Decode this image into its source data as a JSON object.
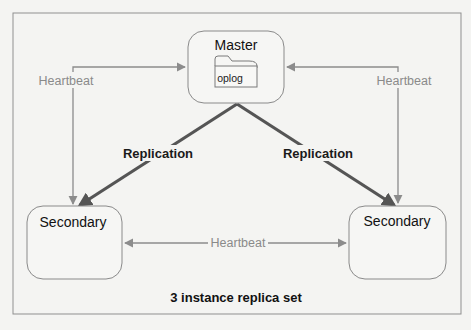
{
  "diagram": {
    "caption": "3 instance replica set",
    "colors": {
      "frame": "#8f8f8f",
      "node_border": "#8a8a8a",
      "node_fill": "#f6f6f4",
      "heartbeat_line": "#8c8c8c",
      "replication_line": "#555555"
    },
    "nodes": {
      "master": {
        "label": "Master",
        "store": "oplog"
      },
      "secondary_left": {
        "label": "Secondary"
      },
      "secondary_right": {
        "label": "Secondary"
      }
    },
    "edges": {
      "heartbeat_left": {
        "label": "Heartbeat"
      },
      "heartbeat_right": {
        "label": "Heartbeat"
      },
      "heartbeat_bottom": {
        "label": "Heartbeat"
      },
      "replication_left": {
        "label": "Replication"
      },
      "replication_right": {
        "label": "Replication"
      }
    }
  }
}
